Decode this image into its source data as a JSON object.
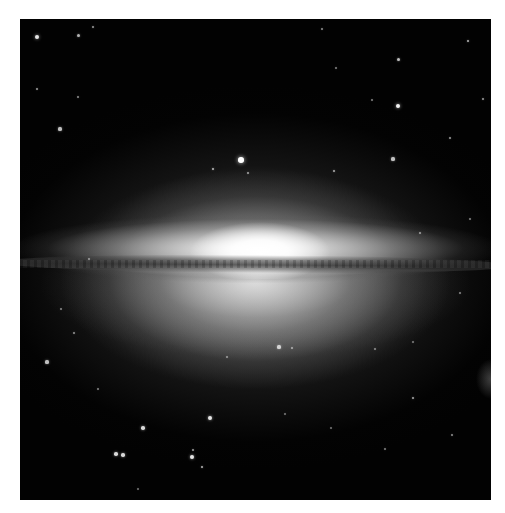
{
  "image": {
    "subject": "edge-on spiral galaxy with bright central bulge and dark dust lane (Sombrero Galaxy)",
    "palette": {
      "background_page": "#ffffff",
      "space": "#020202",
      "core": "#ffffff",
      "dust_lane": "#3a3a3a"
    },
    "frame": {
      "x": 20,
      "y": 19,
      "width": 471,
      "height": 481
    }
  },
  "stars": [
    {
      "x": 17,
      "y": 18,
      "r": 2.2,
      "o": 0.9
    },
    {
      "x": 58,
      "y": 16,
      "r": 1.5,
      "o": 0.7
    },
    {
      "x": 40,
      "y": 110,
      "r": 1.6,
      "o": 0.75
    },
    {
      "x": 17,
      "y": 70,
      "r": 1.2,
      "o": 0.6
    },
    {
      "x": 73,
      "y": 8,
      "r": 1.3,
      "o": 0.6
    },
    {
      "x": 58,
      "y": 78,
      "r": 1.2,
      "o": 0.55
    },
    {
      "x": 221,
      "y": 141,
      "r": 2.8,
      "o": 1.0
    },
    {
      "x": 193,
      "y": 150,
      "r": 1.4,
      "o": 0.7
    },
    {
      "x": 228,
      "y": 154,
      "r": 1.2,
      "o": 0.6
    },
    {
      "x": 378,
      "y": 87,
      "r": 2.3,
      "o": 0.95
    },
    {
      "x": 378,
      "y": 40,
      "r": 1.5,
      "o": 0.75
    },
    {
      "x": 448,
      "y": 22,
      "r": 1.4,
      "o": 0.7
    },
    {
      "x": 373,
      "y": 140,
      "r": 1.6,
      "o": 0.75
    },
    {
      "x": 314,
      "y": 152,
      "r": 1.4,
      "o": 0.65
    },
    {
      "x": 430,
      "y": 119,
      "r": 1.2,
      "o": 0.6
    },
    {
      "x": 463,
      "y": 80,
      "r": 1.3,
      "o": 0.6
    },
    {
      "x": 352,
      "y": 81,
      "r": 1.0,
      "o": 0.5
    },
    {
      "x": 302,
      "y": 10,
      "r": 1.2,
      "o": 0.55
    },
    {
      "x": 316,
      "y": 49,
      "r": 1.1,
      "o": 0.5
    },
    {
      "x": 69,
      "y": 240,
      "r": 1.0,
      "o": 0.5
    },
    {
      "x": 400,
      "y": 214,
      "r": 1.2,
      "o": 0.55
    },
    {
      "x": 450,
      "y": 200,
      "r": 1.1,
      "o": 0.5
    },
    {
      "x": 440,
      "y": 274,
      "r": 1.0,
      "o": 0.5
    },
    {
      "x": 27,
      "y": 343,
      "r": 1.6,
      "o": 0.75
    },
    {
      "x": 54,
      "y": 314,
      "r": 1.2,
      "o": 0.55
    },
    {
      "x": 41,
      "y": 290,
      "r": 1.0,
      "o": 0.5
    },
    {
      "x": 259,
      "y": 328,
      "r": 1.6,
      "o": 0.75
    },
    {
      "x": 272,
      "y": 329,
      "r": 1.1,
      "o": 0.55
    },
    {
      "x": 207,
      "y": 338,
      "r": 1.0,
      "o": 0.5
    },
    {
      "x": 355,
      "y": 330,
      "r": 1.1,
      "o": 0.5
    },
    {
      "x": 393,
      "y": 323,
      "r": 1.0,
      "o": 0.45
    },
    {
      "x": 393,
      "y": 379,
      "r": 1.4,
      "o": 0.65
    },
    {
      "x": 190,
      "y": 399,
      "r": 2.0,
      "o": 0.9
    },
    {
      "x": 123,
      "y": 409,
      "r": 1.8,
      "o": 0.85
    },
    {
      "x": 96,
      "y": 435,
      "r": 1.8,
      "o": 0.85
    },
    {
      "x": 103,
      "y": 436,
      "r": 1.8,
      "o": 0.85
    },
    {
      "x": 172,
      "y": 438,
      "r": 2.0,
      "o": 0.9
    },
    {
      "x": 173,
      "y": 431,
      "r": 1.2,
      "o": 0.6
    },
    {
      "x": 182,
      "y": 448,
      "r": 1.4,
      "o": 0.7
    },
    {
      "x": 432,
      "y": 416,
      "r": 1.2,
      "o": 0.55
    },
    {
      "x": 365,
      "y": 430,
      "r": 1.1,
      "o": 0.5
    },
    {
      "x": 78,
      "y": 370,
      "r": 1.0,
      "o": 0.5
    },
    {
      "x": 311,
      "y": 409,
      "r": 1.0,
      "o": 0.45
    },
    {
      "x": 118,
      "y": 470,
      "r": 1.0,
      "o": 0.45
    },
    {
      "x": 265,
      "y": 395,
      "r": 1.0,
      "o": 0.45
    }
  ]
}
